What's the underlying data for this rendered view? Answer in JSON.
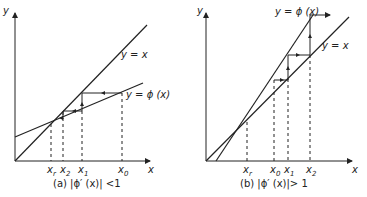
{
  "panels": [
    {
      "id": "a",
      "caption": "(a) |ϕ′ (x)| <1",
      "axis_x": "x",
      "axis_y": "y",
      "line_identity_label": "y = x",
      "line_phi_label": "y = ϕ (x)",
      "ticks": [
        "x_r",
        "x_2",
        "x_1",
        "x_0"
      ],
      "tick_labels": {
        "xr": "x",
        "xr_sub": "r",
        "x2": "x",
        "x2_sub": "2",
        "x1": "x",
        "x1_sub": "1",
        "x0": "x",
        "x0_sub": "0"
      },
      "behavior": "convergent"
    },
    {
      "id": "b",
      "caption": "(b) |ϕ′ (x)|> 1",
      "axis_x": "x",
      "axis_y": "y",
      "line_identity_label": "y = x",
      "line_phi_label": "y = ϕ (x)",
      "ticks": [
        "x_r",
        "x_0",
        "x_1",
        "x_2"
      ],
      "tick_labels": {
        "xr": "x",
        "xr_sub": "r",
        "x0": "x",
        "x0_sub": "0",
        "x1": "x",
        "x1_sub": "1",
        "x2": "x",
        "x2_sub": "2"
      },
      "behavior": "divergent"
    }
  ],
  "colors": {
    "ink": "#222222",
    "background": "#ffffff"
  }
}
